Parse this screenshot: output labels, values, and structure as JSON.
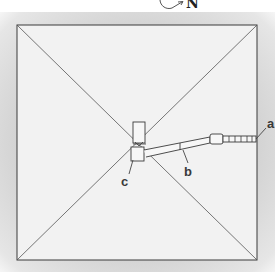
{
  "diagram": {
    "type": "pyramid-floor-plan",
    "compass": {
      "label": "N",
      "icon": "north-arrow-icon"
    },
    "labels": [
      {
        "id": "a",
        "text": "a"
      },
      {
        "id": "b",
        "text": "b"
      },
      {
        "id": "c",
        "text": "c"
      }
    ],
    "colors": {
      "stroke": "#3a3a3a",
      "fill": "#f2f2f2",
      "background": "#d6d6d6"
    }
  }
}
